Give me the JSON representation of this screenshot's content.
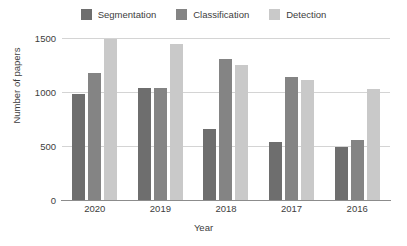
{
  "chart_data": {
    "type": "bar",
    "title": "",
    "xlabel": "Year",
    "ylabel": "Number of papers",
    "categories": [
      "2020",
      "2019",
      "2018",
      "2017",
      "2016"
    ],
    "series": [
      {
        "name": "Segmentation",
        "color": "#6e6e6e",
        "values": [
          985,
          1035,
          660,
          540,
          495
        ]
      },
      {
        "name": "Classification",
        "color": "#848484",
        "values": [
          1175,
          1040,
          1310,
          1140,
          555
        ]
      },
      {
        "name": "Detection",
        "color": "#c9c9c9",
        "values": [
          1490,
          1445,
          1250,
          1110,
          1025
        ]
      }
    ],
    "ylim": [
      0,
      1500
    ],
    "yticks": [
      0,
      500,
      1000,
      1500
    ],
    "ytick_labels": [
      "0",
      "500",
      "1000",
      "1500"
    ],
    "grid": true,
    "legend_position": "top-center",
    "orientation": "vertical",
    "grouping": "grouped"
  },
  "legend": {
    "items": [
      {
        "label": "Segmentation",
        "color": "#6e6e6e"
      },
      {
        "label": "Classification",
        "color": "#848484"
      },
      {
        "label": "Detection",
        "color": "#c9c9c9"
      }
    ]
  },
  "axes": {
    "x_title": "Year",
    "y_title": "Number of papers"
  }
}
